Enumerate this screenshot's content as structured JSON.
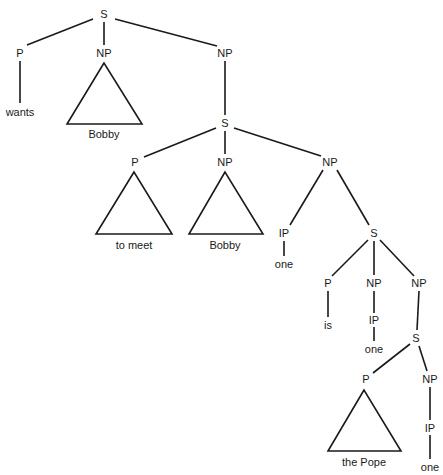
{
  "tree": {
    "nodes": [
      {
        "id": "s1",
        "label": "S",
        "x": 104,
        "y": 14
      },
      {
        "id": "p1",
        "label": "P",
        "x": 20,
        "y": 53
      },
      {
        "id": "np1",
        "label": "NP",
        "x": 104,
        "y": 53
      },
      {
        "id": "np2",
        "label": "NP",
        "x": 225,
        "y": 53
      },
      {
        "id": "w1",
        "label": "wants",
        "x": 20,
        "y": 112
      },
      {
        "id": "t1",
        "label": "Bobby",
        "x": 104,
        "y": 134
      },
      {
        "id": "s2",
        "label": "S",
        "x": 225,
        "y": 123
      },
      {
        "id": "p2",
        "label": "P",
        "x": 135,
        "y": 162
      },
      {
        "id": "np3",
        "label": "NP",
        "x": 225,
        "y": 162
      },
      {
        "id": "np4",
        "label": "NP",
        "x": 330,
        "y": 162
      },
      {
        "id": "t2",
        "label": "to meet",
        "x": 134,
        "y": 245
      },
      {
        "id": "t3",
        "label": "Bobby",
        "x": 225,
        "y": 245
      },
      {
        "id": "ip1",
        "label": "IP",
        "x": 284,
        "y": 233
      },
      {
        "id": "w2",
        "label": "one",
        "x": 284,
        "y": 264
      },
      {
        "id": "s3",
        "label": "S",
        "x": 374,
        "y": 233
      },
      {
        "id": "p3",
        "label": "P",
        "x": 328,
        "y": 283
      },
      {
        "id": "np5",
        "label": "NP",
        "x": 374,
        "y": 283
      },
      {
        "id": "np6",
        "label": "NP",
        "x": 419,
        "y": 283
      },
      {
        "id": "w3",
        "label": "is",
        "x": 328,
        "y": 325
      },
      {
        "id": "ip2",
        "label": "IP",
        "x": 374,
        "y": 320
      },
      {
        "id": "w4",
        "label": "one",
        "x": 374,
        "y": 349
      },
      {
        "id": "s4",
        "label": "S",
        "x": 416,
        "y": 338
      },
      {
        "id": "p4",
        "label": "P",
        "x": 366,
        "y": 379
      },
      {
        "id": "np7",
        "label": "NP",
        "x": 430,
        "y": 379
      },
      {
        "id": "ip3",
        "label": "IP",
        "x": 430,
        "y": 428
      },
      {
        "id": "t4",
        "label": "the Pope",
        "x": 364,
        "y": 462
      },
      {
        "id": "w5",
        "label": "one",
        "x": 430,
        "y": 467
      }
    ],
    "edges": [
      [
        93,
        19,
        27,
        45
      ],
      [
        104,
        22,
        104,
        45
      ],
      [
        115,
        19,
        217,
        46
      ],
      [
        20,
        61,
        20,
        103
      ],
      [
        225,
        61,
        225,
        115
      ],
      [
        216,
        128,
        144,
        157
      ],
      [
        225,
        131,
        225,
        154
      ],
      [
        234,
        128,
        321,
        156
      ],
      [
        323,
        170,
        290,
        225
      ],
      [
        337,
        170,
        369,
        225
      ],
      [
        284,
        241,
        284,
        256
      ],
      [
        368,
        240,
        332,
        276
      ],
      [
        374,
        241,
        374,
        275
      ],
      [
        380,
        240,
        414,
        276
      ],
      [
        328,
        291,
        328,
        317
      ],
      [
        374,
        291,
        374,
        313
      ],
      [
        374,
        327,
        374,
        341
      ],
      [
        419,
        291,
        417,
        330
      ],
      [
        410,
        344,
        373,
        373
      ],
      [
        419,
        346,
        427,
        371
      ],
      [
        430,
        387,
        430,
        420
      ],
      [
        430,
        435,
        430,
        459
      ]
    ],
    "triangles": [
      {
        "apex": [
          104,
          63
        ],
        "base_left": [
          67,
          124
        ],
        "base_right": [
          142,
          124
        ]
      },
      {
        "apex": [
          134,
          172
        ],
        "base_left": [
          96,
          234
        ],
        "base_right": [
          172,
          234
        ]
      },
      {
        "apex": [
          225,
          172
        ],
        "base_left": [
          189,
          234
        ],
        "base_right": [
          263,
          234
        ]
      },
      {
        "apex": [
          364,
          390
        ],
        "base_left": [
          328,
          451
        ],
        "base_right": [
          401,
          451
        ]
      }
    ],
    "line_color": "#1a1a1a"
  }
}
